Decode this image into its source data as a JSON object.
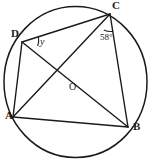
{
  "figure": {
    "type": "circle-geometry-diagram",
    "stroke_color": "#1a1a1a",
    "background_color": "#ffffff",
    "circle": {
      "cx": 75.5,
      "cy": 82,
      "r": 71.5
    },
    "points": [
      {
        "name": "A",
        "label": "A",
        "x": 13,
        "y": 117,
        "label_x": 5,
        "label_y": 115
      },
      {
        "name": "B",
        "label": "B",
        "x": 128,
        "y": 127,
        "label_x": 133,
        "label_y": 126
      },
      {
        "name": "C",
        "label": "C",
        "x": 110,
        "y": 14,
        "label_x": 112,
        "label_y": 1
      },
      {
        "name": "D",
        "label": "D",
        "x": 22,
        "y": 42,
        "label_x": 11,
        "label_y": 31
      },
      {
        "name": "O",
        "label": "O",
        "x": 75,
        "y": 82,
        "label_x": 69,
        "label_y": 85
      }
    ],
    "segments": [
      {
        "name": "DC",
        "from": "D",
        "to": "C"
      },
      {
        "name": "CB",
        "from": "C",
        "to": "B"
      },
      {
        "name": "AB",
        "from": "A",
        "to": "B"
      },
      {
        "name": "AD",
        "from": "A",
        "to": "D"
      },
      {
        "name": "DB",
        "from": "D",
        "to": "B"
      },
      {
        "name": "CA",
        "from": "C",
        "to": "A"
      }
    ],
    "angles": [
      {
        "name": "angle-y-at-D",
        "label": "y",
        "vertex": "D",
        "label_x": 39,
        "label_y": 40
      },
      {
        "name": "angle-58-at-C",
        "label": "58°",
        "vertex": "C",
        "label_x": 101,
        "label_y": 36
      }
    ]
  }
}
